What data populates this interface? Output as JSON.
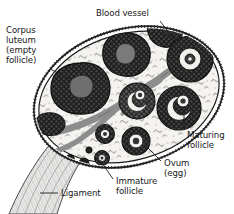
{
  "figure": {
    "canvas": {
      "width": 234,
      "height": 214
    },
    "background_color": "#ffffff",
    "ink_color": "#171717",
    "stroma_color": "#f4f2ef",
    "follicle_dark_color": "#232323",
    "follicle_mid_color": "#3c3c3c",
    "vessel_color": "#8e8e8e",
    "corpus_center_color": "#6e6e6e",
    "ligament_color": "#efefef"
  },
  "labels": [
    {
      "id": "blood-vessel",
      "text": "Blood vessel",
      "lines": [
        "Blood vessel"
      ],
      "x": 96,
      "y": 9,
      "align": "left",
      "leader": {
        "x1": 160,
        "y1": 21,
        "x2": 176,
        "y2": 42
      }
    },
    {
      "id": "corpus-luteum",
      "text": "Corpus luteum (empty follicle)",
      "lines": [
        "Corpus",
        "luteum",
        "(empty",
        "follicle)"
      ],
      "x": 6,
      "y": 26,
      "align": "left",
      "leader": {
        "x1": 50,
        "y1": 69,
        "x2": 70,
        "y2": 79
      }
    },
    {
      "id": "maturing-follicle",
      "text": "Maturing follicle",
      "lines": [
        "Maturing",
        "follicle"
      ],
      "x": 187,
      "y": 131,
      "align": "left",
      "leader": {
        "x1": 184,
        "y1": 129,
        "x2": 184,
        "y2": 108
      }
    },
    {
      "id": "ovum-egg",
      "text": "Ovum (egg)",
      "lines": [
        "Ovum",
        "(egg)"
      ],
      "x": 164,
      "y": 159,
      "align": "left",
      "leader": {
        "x1": 161,
        "y1": 161,
        "x2": 146,
        "y2": 146
      }
    },
    {
      "id": "immature-follicle",
      "text": "Immature follicle",
      "lines": [
        "Immature",
        "follicle"
      ],
      "x": 116,
      "y": 177,
      "align": "left",
      "leader": {
        "x1": 113,
        "y1": 179,
        "x2": 101,
        "y2": 161
      }
    },
    {
      "id": "ligament",
      "text": "Ligament",
      "lines": [
        "Ligament"
      ],
      "x": 60,
      "y": 189,
      "align": "left",
      "leader": {
        "x1": 57,
        "y1": 193,
        "x2": 40,
        "y2": 193
      }
    }
  ],
  "structures": {
    "ovary_outline": "tilted ellipse with double wall and stippled cortex",
    "corpus_lutea": [
      {
        "id": "corpus-luteum-large",
        "cx": 80,
        "cy": 88,
        "rx": 28,
        "ry": 25
      },
      {
        "id": "corpus-luteum-upper",
        "cx": 124,
        "cy": 52,
        "rx": 21,
        "ry": 19
      },
      {
        "id": "corpus-luteum-edge",
        "cx": 164,
        "cy": 30,
        "rx": 15,
        "ry": 16
      }
    ],
    "maturing_follicles": [
      {
        "id": "maturing-follicle-right-top",
        "cx": 189,
        "cy": 59,
        "r": 22
      },
      {
        "id": "maturing-follicle-right-low",
        "cx": 178,
        "cy": 107,
        "r": 21
      },
      {
        "id": "maturing-follicle-mid",
        "cx": 137,
        "cy": 100,
        "r": 17
      },
      {
        "id": "maturing-follicle-small",
        "cx": 135,
        "cy": 140,
        "r": 13
      },
      {
        "id": "maturing-follicle-tiny",
        "cx": 104,
        "cy": 133,
        "r": 9
      },
      {
        "id": "maturing-follicle-micro",
        "cx": 101,
        "cy": 157,
        "r": 7
      }
    ],
    "immature_follicles": [
      {
        "id": "immature-follicle-cluster",
        "cx": 52,
        "cy": 122,
        "rx": 12,
        "ry": 9
      },
      {
        "id": "immature-follicle-dot-1",
        "cx": 69,
        "cy": 158,
        "r": 4
      },
      {
        "id": "immature-follicle-dot-2",
        "cx": 82,
        "cy": 162,
        "r": 4.5
      },
      {
        "id": "immature-follicle-dot-3",
        "cx": 88,
        "cy": 150,
        "r": 3
      }
    ],
    "blood_vessels": [
      {
        "id": "vessel-main-diagonal"
      },
      {
        "id": "vessel-branch-lower"
      },
      {
        "id": "vessel-hilum"
      }
    ],
    "ligament": {
      "id": "ligament-stalk",
      "description": "striated tapering stalk exiting lower-left"
    }
  }
}
